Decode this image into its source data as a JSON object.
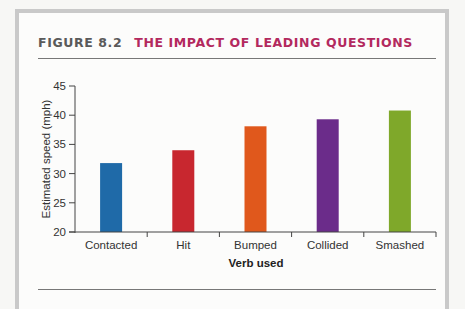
{
  "figure": {
    "number": "FIGURE 8.2",
    "title": "THE IMPACT OF LEADING QUESTIONS"
  },
  "colors": {
    "title_number": "#5a5a5a",
    "title_text": "#b3295e",
    "frame": "#c9c9c9"
  },
  "chart_data": {
    "type": "bar",
    "title": "THE IMPACT OF LEADING QUESTIONS",
    "categories": [
      "Contacted",
      "Hit",
      "Bumped",
      "Collided",
      "Smashed"
    ],
    "values": [
      31.8,
      34.0,
      38.1,
      39.3,
      40.8
    ],
    "bar_colors": [
      "#1f6aa8",
      "#c8272f",
      "#e0581c",
      "#6b2c8a",
      "#7fa82a"
    ],
    "xlabel": "Verb used",
    "ylabel": "Estimated speed (mph)",
    "ylim": [
      20,
      45
    ],
    "yticks": [
      20,
      25,
      30,
      35,
      40,
      45
    ],
    "grid": false,
    "legend": null
  }
}
